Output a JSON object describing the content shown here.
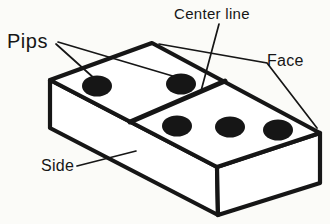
{
  "diagram": {
    "type": "labeled-illustration",
    "labels": {
      "pips": "Pips",
      "center_line": "Center line",
      "face": "Face",
      "side": "Side"
    },
    "pips": {
      "left_half_count": 2,
      "right_half_count": 3,
      "left_positions": [
        [
          97,
          86
        ],
        [
          181,
          84
        ]
      ],
      "right_positions": [
        [
          177,
          126
        ],
        [
          230,
          127
        ],
        [
          278,
          130
        ]
      ]
    }
  },
  "colors": {
    "ink": "#161616",
    "paper": "#fbfbf8",
    "face_fill": "#ffffff"
  }
}
